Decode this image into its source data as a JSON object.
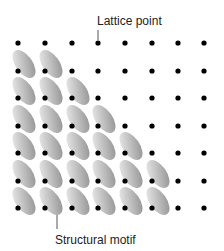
{
  "labels": {
    "lattice_point": "Lattice point",
    "structural_motif": "Structural motif"
  },
  "grid": {
    "columns_x": [
      18,
      45,
      72,
      98,
      125,
      152,
      178,
      204
    ],
    "rows_y": [
      43,
      71,
      98,
      126,
      153,
      181,
      208
    ],
    "motifs_per_row": [
      0,
      2,
      3,
      4,
      5,
      6,
      6
    ],
    "dot_radius": 2.6,
    "dot_color": "#000000"
  },
  "motif": {
    "rx": 8.5,
    "ry": 16,
    "rotate_deg": -35,
    "offset_x": 6,
    "offset_y": -7,
    "gradient_light": "#f2f2f2",
    "gradient_dark": "#8a8a8a"
  },
  "leaders": {
    "lattice_point": {
      "x": 98,
      "y1": 30,
      "y2": 40
    },
    "structural_motif": {
      "x": 57,
      "y1": 215,
      "y2": 229
    }
  },
  "colors": {
    "text": "#222222",
    "leader": "#555555"
  }
}
